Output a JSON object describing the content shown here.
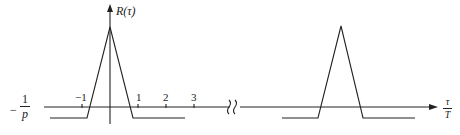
{
  "diagram": {
    "y_axis_label": "R(τ)",
    "x_axis_label": {
      "numerator": "τ",
      "denominator": "T"
    },
    "level_label": {
      "sign": "−",
      "numerator": "1",
      "denominator": "p"
    },
    "tick_labels": [
      "−1",
      "1",
      "2",
      "3"
    ],
    "axis_break_symbol": "≀≀",
    "colors": {
      "line": "#222222",
      "background": "#ffffff"
    }
  }
}
